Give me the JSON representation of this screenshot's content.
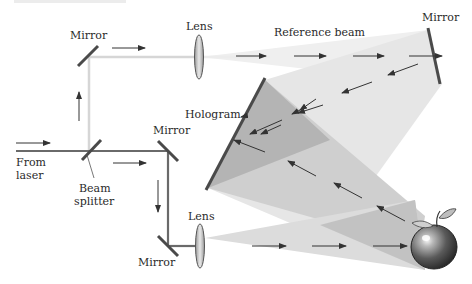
{
  "diagram": {
    "labels": {
      "mirror_top_left": "Mirror",
      "lens_top": "Lens",
      "reference_beam": "Reference beam",
      "mirror_top_right": "Mirror",
      "hologram": "Hologram",
      "mirror_middle": "Mirror",
      "from_laser_line1": "From",
      "from_laser_line2": "laser",
      "beam_splitter_line1": "Beam",
      "beam_splitter_line2": "splitter",
      "lens_bottom": "Lens",
      "mirror_bottom": "Mirror"
    },
    "components": [
      {
        "type": "laser-input",
        "label": "From laser"
      },
      {
        "type": "beam-splitter",
        "label": "Beam splitter"
      },
      {
        "type": "mirror",
        "label": "Mirror",
        "position": "top-left"
      },
      {
        "type": "lens",
        "label": "Lens",
        "position": "top"
      },
      {
        "type": "mirror",
        "label": "Mirror",
        "position": "top-right"
      },
      {
        "type": "hologram",
        "label": "Hologram"
      },
      {
        "type": "mirror",
        "label": "Mirror",
        "position": "middle"
      },
      {
        "type": "mirror",
        "label": "Mirror",
        "position": "bottom"
      },
      {
        "type": "lens",
        "label": "Lens",
        "position": "bottom"
      },
      {
        "type": "object",
        "label": "apple"
      }
    ],
    "beams": [
      {
        "name": "reference beam",
        "path": "beam splitter → top-left mirror → lens → top-right mirror → hologram"
      },
      {
        "name": "object beam",
        "path": "beam splitter → middle mirror → bottom mirror → lens → apple → hologram"
      }
    ],
    "colors": {
      "beam_reference": "#d8d8d8",
      "beam_object": "#6e6e6e",
      "mirror": "#4a4a4a",
      "cone_light": "#e2e2e2",
      "cone_mid": "#c4c4c4",
      "cone_dark": "#a8a8a8",
      "arrow": "#333333"
    }
  }
}
